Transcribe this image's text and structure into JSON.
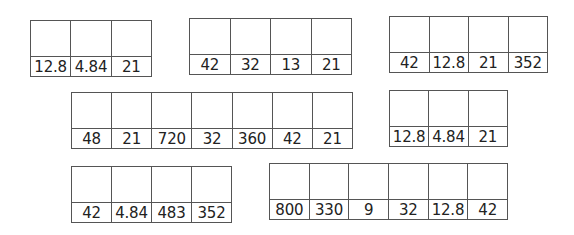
{
  "tables": [
    {
      "id": "t1",
      "values": [
        "12.8",
        "4.84",
        "21"
      ]
    },
    {
      "id": "t2",
      "values": [
        "42",
        "32",
        "13",
        "21"
      ]
    },
    {
      "id": "t3",
      "values": [
        "42",
        "12.8",
        "21",
        "352"
      ]
    },
    {
      "id": "t4",
      "values": [
        "48",
        "21",
        "720",
        "32",
        "360",
        "42",
        "21"
      ]
    },
    {
      "id": "t5",
      "values": [
        "12.8",
        "4.84",
        "21"
      ]
    },
    {
      "id": "t6",
      "values": [
        "42",
        "4.84",
        "483",
        "352"
      ]
    },
    {
      "id": "t7",
      "values": [
        "800",
        "330",
        "9",
        "32",
        "12.8",
        "42"
      ]
    }
  ],
  "colors": {
    "border": "#555555",
    "text": "#222222",
    "background": "#ffffff"
  }
}
